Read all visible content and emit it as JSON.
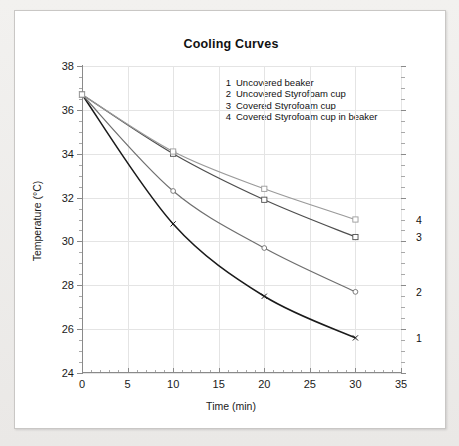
{
  "chart_data": {
    "type": "line",
    "title": "Cooling Curves",
    "xlabel": "Time (min)",
    "ylabel": "Temperature (°C)",
    "xlim": [
      0,
      35
    ],
    "ylim": [
      24,
      38
    ],
    "xticks": [
      0,
      5,
      10,
      15,
      20,
      25,
      30,
      35
    ],
    "yticks": [
      24,
      26,
      28,
      30,
      32,
      34,
      36,
      38
    ],
    "x_minor_step": 1,
    "y_minor_step": 0.5,
    "grid": true,
    "legend_position": "inside-top-right",
    "x": [
      0,
      10,
      20,
      30
    ],
    "series": [
      {
        "name": "1",
        "label": "Uncovered beaker",
        "values": [
          36.7,
          30.8,
          27.5,
          25.6
        ],
        "color": "#1a1a1a",
        "marker": "x",
        "end_label": "1"
      },
      {
        "name": "2",
        "label": "Uncovered Styrofoam cup",
        "values": [
          36.7,
          32.3,
          29.7,
          27.7
        ],
        "color": "#6f6f6f",
        "marker": "circle",
        "end_label": "2"
      },
      {
        "name": "3",
        "label": "Covered Styrofoam cup",
        "values": [
          36.7,
          34.0,
          31.9,
          30.2
        ],
        "color": "#4e4e4e",
        "marker": "square",
        "end_label": "3"
      },
      {
        "name": "4",
        "label": "Covered Styrofoam cup in beaker",
        "values": [
          36.7,
          34.1,
          32.4,
          31.0
        ],
        "color": "#9a9a9a",
        "marker": "square",
        "end_label": "4"
      }
    ],
    "legend_entries": [
      {
        "number": "1",
        "text": "Uncovered beaker"
      },
      {
        "number": "2",
        "text": "Uncovered Styrofoam cup"
      },
      {
        "number": "3",
        "text": "Covered Styrofoam cup"
      },
      {
        "number": "4",
        "text": "Covered Styrofoam cup in beaker"
      }
    ],
    "end_labels": [
      {
        "text": "4",
        "value": 31.0
      },
      {
        "text": "3",
        "value": 30.2
      },
      {
        "text": "2",
        "value": 27.7
      },
      {
        "text": "1",
        "value": 25.6
      }
    ]
  },
  "colors": {
    "page_background": "#eceae8",
    "card_background": "#ffffff",
    "grid": "#e4e4e4",
    "axis": "#8a8a8a",
    "text": "#111111"
  }
}
